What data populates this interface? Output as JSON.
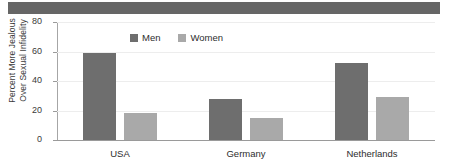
{
  "banner": {
    "present": true,
    "color": "#666666"
  },
  "chart_data": {
    "type": "bar",
    "title": "",
    "xlabel": "",
    "ylabel": "Percent More Jealous Over Sexual Infidelity",
    "ylabel_line1": "Percent More Jealous",
    "ylabel_line2": "Over Sexual Infidelity",
    "categories": [
      "USA",
      "Germany",
      "Netherlands"
    ],
    "series": [
      {
        "name": "Men",
        "color": "#6e6e6e",
        "values": [
          59,
          28,
          52
        ]
      },
      {
        "name": "Women",
        "color": "#a9a9a9",
        "values": [
          18,
          15,
          29
        ]
      }
    ],
    "ylim": [
      0,
      80
    ],
    "yticks": [
      0,
      20,
      40,
      60,
      80
    ],
    "ytick_labels": [
      "0",
      "20",
      "40",
      "60",
      "80"
    ],
    "grid": true,
    "legend": [
      "Men",
      "Women"
    ],
    "legend_position": "top-left-inside"
  }
}
